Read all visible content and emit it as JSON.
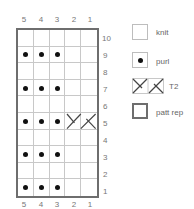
{
  "chart": {
    "columns": [
      "5",
      "4",
      "3",
      "2",
      "1"
    ],
    "rows": [
      "10",
      "9",
      "8",
      "7",
      "6",
      "5",
      "4",
      "3",
      "2",
      "1"
    ],
    "purl_rows": [
      9,
      7,
      5,
      3,
      1
    ],
    "purl_columns": [
      5,
      4,
      3
    ],
    "t2": {
      "row": 5,
      "columns": [
        2,
        1
      ]
    }
  },
  "legend": {
    "knit": "knit",
    "purl": "purl",
    "t2": "T2",
    "patt_rep": "patt rep"
  },
  "colors": {
    "grid_line": "#c8c8c8",
    "border": "#6e6e6e",
    "purl_dot": "#111111"
  }
}
